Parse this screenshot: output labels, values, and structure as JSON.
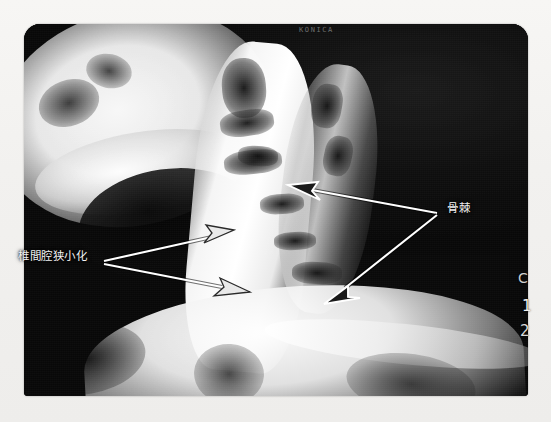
{
  "image": {
    "kind": "radiograph",
    "view": "lateral cervical spine X-ray photograph",
    "background_color": "#f2f1ef",
    "film_color": "#0c0c0c"
  },
  "annotations": {
    "disc_narrowing": {
      "label": "椎間腔狭小化",
      "meaning": "intervertebral disc space narrowing",
      "arrow_count": 2,
      "text_color": "#f2f2f2"
    },
    "osteophyte": {
      "label": "骨棘",
      "meaning": "osteophyte / bone spur",
      "arrow_count": 2,
      "text_color": "#f2f2f2"
    }
  },
  "film_markings": {
    "manufacturer_imprint": "KONICA",
    "edge_marker_c": "C",
    "edge_marker_1": "1",
    "edge_marker_2": "2"
  },
  "caption": {
    "text": ""
  }
}
